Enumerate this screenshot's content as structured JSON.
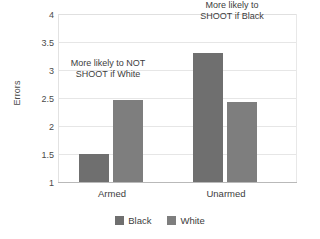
{
  "chart_data": {
    "type": "bar",
    "title": "",
    "xlabel": "",
    "ylabel": "Errors",
    "categories": [
      "Armed",
      "Unarmed"
    ],
    "series": [
      {
        "name": "Black",
        "values": [
          1.5,
          3.3
        ],
        "color": "#6f6f6f"
      },
      {
        "name": "White",
        "values": [
          2.47,
          2.42
        ],
        "color": "#7e7e7e"
      }
    ],
    "ylim": [
      1,
      4
    ],
    "yticks": [
      "1",
      "1.5",
      "2",
      "2.5",
      "3",
      "3.5",
      "4"
    ],
    "ytick_values": [
      1,
      1.5,
      2,
      2.5,
      3,
      3.5,
      4
    ],
    "grid": true,
    "legend_position": "bottom",
    "annotations": [
      {
        "text": "More likely to NOT\nSHOOT if White",
        "target": "Armed-White"
      },
      {
        "text": "More likely to\nSHOOT if Black",
        "target": "Unarmed-Black"
      }
    ]
  },
  "axis": {
    "y_title": "Errors",
    "tick_4": "4",
    "tick_35": "3.5",
    "tick_3": "3",
    "tick_25": "2.5",
    "tick_2": "2",
    "tick_15": "1.5",
    "tick_1": "1"
  },
  "categories": {
    "armed": "Armed",
    "unarmed": "Unarmed"
  },
  "annotations": {
    "not_shoot_white": "More likely to NOT\nSHOOT if White",
    "shoot_black": "More likely to\nSHOOT if Black"
  },
  "legend": {
    "black_label": "Black",
    "white_label": "White"
  },
  "colors": {
    "series_black": "#6f6f6f",
    "series_white": "#7e7e7e",
    "gridline": "#e6e6e6",
    "axis": "#b9b9b9",
    "text": "#3d3d3d",
    "background": "#ffffff"
  }
}
